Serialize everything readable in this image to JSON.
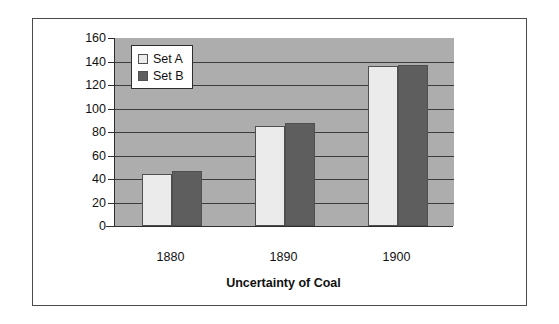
{
  "chart_data": {
    "type": "bar",
    "title": "",
    "xlabel": "Uncertainty of Coal",
    "ylabel": "Millions of Short Tons",
    "categories": [
      "1880",
      "1890",
      "1900"
    ],
    "series": [
      {
        "name": "Set A",
        "values": [
          44,
          85,
          136
        ],
        "color": "#ebebeb"
      },
      {
        "name": "Set B",
        "values": [
          47,
          88,
          137
        ],
        "color": "#5e5e5e"
      }
    ],
    "ylim": [
      0,
      160
    ],
    "ytick_values": [
      0,
      20,
      40,
      60,
      80,
      100,
      120,
      140,
      160
    ],
    "ytick_labels": [
      "0",
      "20",
      "40",
      "60",
      "80",
      "100",
      "120",
      "140",
      "160"
    ],
    "grid": true,
    "grid_axis": "y",
    "legend_position": "upper left",
    "plot_background": "#adadad",
    "gridline_color": "#3c3c3c",
    "axis_color": "#2e2e2e",
    "figure_background": "#ffffff",
    "frame_color": "#4a4a4a"
  }
}
